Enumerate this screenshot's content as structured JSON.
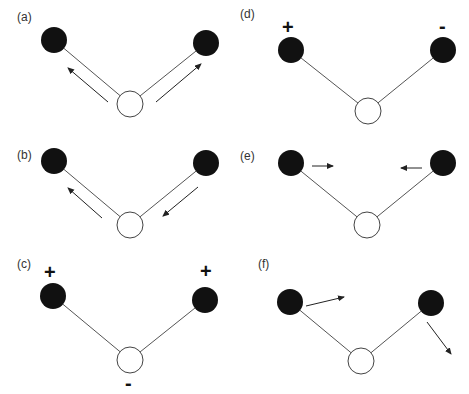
{
  "figure": {
    "colors": {
      "outer_atom": "#111111",
      "center_atom": "#ffffff",
      "bond": "#555555",
      "arrow": "#222222"
    },
    "panels": [
      {
        "id": "a",
        "label": "(a)",
        "signs": [],
        "arrows": [
          "left-atom up-left along bond",
          "right-atom up-right along bond"
        ]
      },
      {
        "id": "b",
        "label": "(b)",
        "signs": [],
        "arrows": [
          "left-atom up-left along bond",
          "right-atom down-left along bond"
        ]
      },
      {
        "id": "c",
        "label": "(c)",
        "signs": [
          "+",
          "+",
          "-"
        ],
        "arrows": []
      },
      {
        "id": "d",
        "label": "(d)",
        "signs": [
          "+",
          "-"
        ],
        "arrows": []
      },
      {
        "id": "e",
        "label": "(e)",
        "signs": [],
        "arrows": [
          "left-atom right",
          "right-atom left"
        ]
      },
      {
        "id": "f",
        "label": "(f)",
        "signs": [],
        "arrows": [
          "left-atom right",
          "right-atom down-right"
        ]
      }
    ]
  }
}
